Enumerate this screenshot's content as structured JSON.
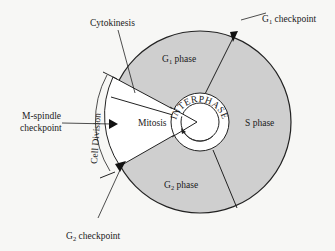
{
  "diagram": {
    "colors": {
      "background": "#f7f7f5",
      "interphase_fill": "#cfcfcf",
      "mitosis_fill": "#ffffff",
      "stroke": "#222222",
      "checkpoint": "#111111"
    },
    "phases": {
      "g1": "G",
      "g1_sub": "1",
      "g1_suffix": " phase",
      "s": "S phase",
      "g2": "G",
      "g2_sub": "2",
      "g2_suffix": " phase",
      "mitosis": "Mitosis",
      "cytokinesis": "Cytokinesis",
      "interphase": "INTERPHASE",
      "cell_division": "Cell Division"
    },
    "checkpoints": {
      "g1_prefix": "G",
      "g1_sub": "1",
      "g1_suffix": " checkpoint",
      "m_line1": "M-spindle",
      "m_line2": "checkpoint",
      "g2_prefix": "G",
      "g2_sub": "2",
      "g2_suffix": " checkpoint"
    }
  }
}
